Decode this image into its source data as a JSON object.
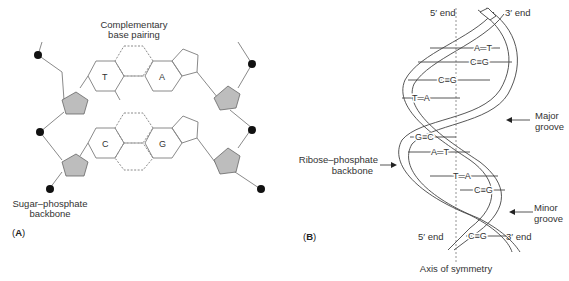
{
  "panel_a": {
    "label_prefix": "(",
    "label": "A",
    "label_suffix": ")",
    "title_line1": "Complementary",
    "title_line2": "base pairing",
    "backbone_line1": "Sugar–phosphate",
    "backbone_line2": "backbone",
    "pairs": [
      {
        "left": "T",
        "right": "A"
      },
      {
        "left": "C",
        "right": "G"
      }
    ]
  },
  "panel_b": {
    "label": "B",
    "five_end_top": "5′ end",
    "three_end_top": "3′ end",
    "five_end_bottom": "5′ end",
    "three_end_bottom": "3′ end",
    "major_groove_line1": "Major",
    "major_groove_line2": "groove",
    "minor_groove_line1": "Minor",
    "minor_groove_line2": "groove",
    "backbone_line1": "Ribose–phosphate",
    "backbone_line2": "backbone",
    "axis": "Axis of symmetry",
    "base_pairs": [
      "A═T",
      "C≡G",
      "C≡G",
      "T═A",
      "G≡C",
      "A═T",
      "T═A",
      "C≡G",
      "C≡G"
    ]
  },
  "colors": {
    "line": "#8a8a8a",
    "sugar_fill": "#bdbdbd",
    "phosphate": "#111111",
    "text": "#333333"
  }
}
